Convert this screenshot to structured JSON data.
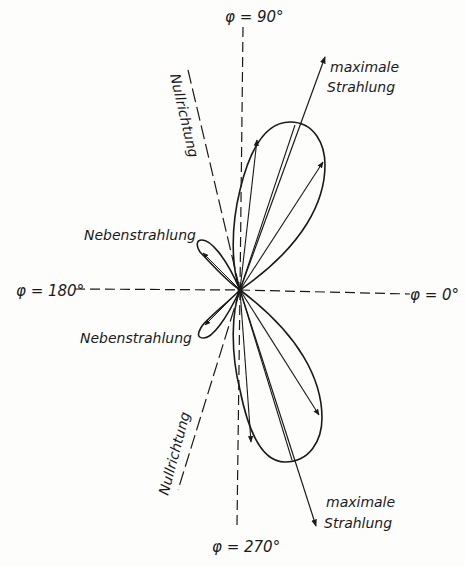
{
  "diagram": {
    "type": "antenna-radiation-pattern",
    "axes": {
      "deg90": "φ = 90°",
      "deg180": "φ = 180°",
      "deg0": "φ = 0°",
      "deg270": "φ = 270°"
    },
    "labels": {
      "max_upper_line1": "maximale",
      "max_upper_line2": "Strahlung",
      "max_lower_line1": "maximale",
      "max_lower_line2": "Strahlung",
      "null_upper": "Nullrichtung",
      "null_lower": "Nullrichtung",
      "side_upper": "Nebenstrahlung",
      "side_lower": "Nebenstrahlung"
    },
    "lobes": [
      {
        "name": "main-upper",
        "direction_deg": 67,
        "relative_length": 1.0
      },
      {
        "name": "main-lower",
        "direction_deg": -67,
        "relative_length": 1.0
      },
      {
        "name": "side-upper",
        "direction_deg": 148,
        "relative_length": 0.22
      },
      {
        "name": "side-lower",
        "direction_deg": 212,
        "relative_length": 0.22
      }
    ],
    "null_directions_deg": [
      112,
      248
    ],
    "colors": {
      "ink": "#1a1a1a",
      "paper": "#fdfdfb"
    }
  }
}
